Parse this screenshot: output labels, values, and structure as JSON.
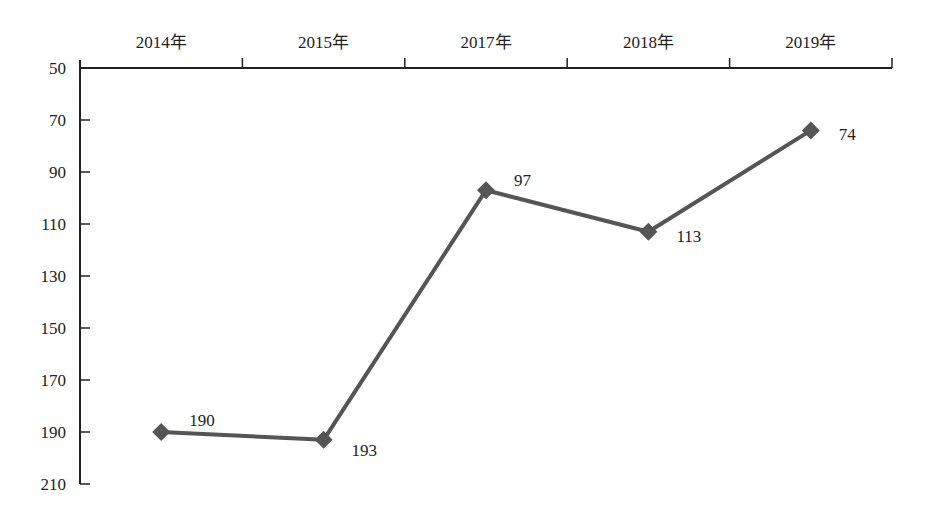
{
  "chart_data": {
    "type": "line",
    "title": "",
    "xlabel": "",
    "ylabel": "",
    "categories": [
      "2014年",
      "2015年",
      "2017年",
      "2018年",
      "2019年"
    ],
    "series": [
      {
        "name": "",
        "values": [
          190,
          193,
          97,
          113,
          74
        ],
        "color": "#555555",
        "marker": "diamond"
      }
    ],
    "data_labels": [
      "190",
      "193",
      "97",
      "113",
      "74"
    ],
    "ylim": [
      50,
      210
    ],
    "y_inverted": true,
    "yticks": [
      50,
      70,
      90,
      110,
      130,
      150,
      170,
      190,
      210
    ],
    "ytick_labels": [
      "50",
      "70",
      "90",
      "110",
      "130",
      "150",
      "170",
      "190",
      "210"
    ],
    "x_axis_position": "top",
    "grid": false,
    "legend": "none"
  }
}
